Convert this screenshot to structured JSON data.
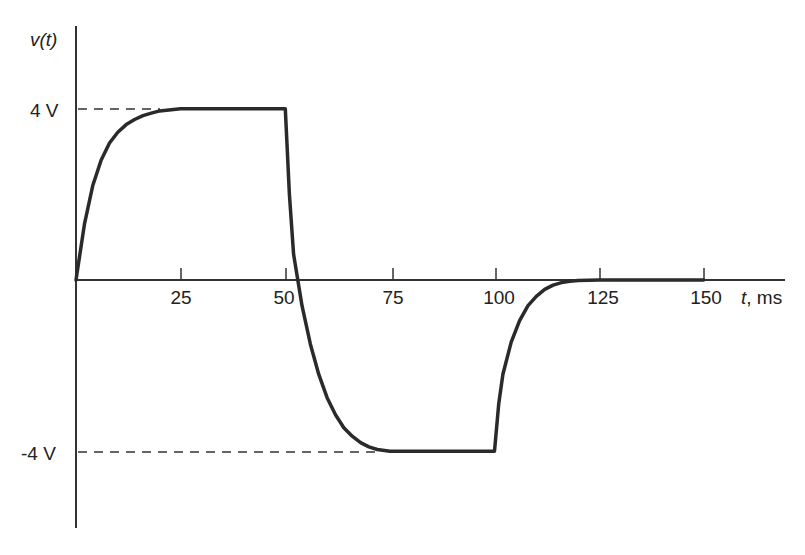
{
  "chart_data": {
    "type": "line",
    "title": "",
    "ylabel": "v(t)",
    "xlabel": "t, ms",
    "x_ticks": [
      25,
      50,
      75,
      100,
      125,
      150
    ],
    "x_tick_labels": [
      "25",
      "50",
      "75",
      "100",
      "125",
      "150"
    ],
    "y_ticks": [
      4,
      -4
    ],
    "y_tick_labels": [
      "4 V",
      "-4 V"
    ],
    "xlim": [
      0,
      160
    ],
    "ylim": [
      -6,
      6
    ],
    "grid": false,
    "reference_lines": [
      {
        "y": 4,
        "style": "dashed",
        "from_x": 0,
        "to_x": 20
      },
      {
        "y": -4,
        "style": "dashed",
        "from_x": 0,
        "to_x": 72
      }
    ],
    "series": [
      {
        "name": "v(t)",
        "x": [
          0,
          2,
          4,
          6,
          8,
          10,
          12,
          14,
          16,
          18,
          20,
          25,
          50,
          51,
          52,
          53,
          54,
          56,
          58,
          60,
          62,
          64,
          66,
          68,
          70,
          72,
          75,
          100,
          101,
          102,
          104,
          106,
          108,
          110,
          112,
          114,
          116,
          118,
          120,
          125,
          150
        ],
        "values": [
          0,
          1.3,
          2.2,
          2.8,
          3.2,
          3.45,
          3.63,
          3.75,
          3.84,
          3.9,
          3.95,
          4.0,
          4.0,
          2.0,
          0.6,
          0.0,
          -0.6,
          -1.5,
          -2.2,
          -2.75,
          -3.15,
          -3.45,
          -3.65,
          -3.8,
          -3.9,
          -3.96,
          -4.0,
          -4.0,
          -2.9,
          -2.2,
          -1.45,
          -0.95,
          -0.6,
          -0.38,
          -0.22,
          -0.12,
          -0.06,
          -0.03,
          -0.01,
          0.0,
          0.0
        ]
      }
    ]
  },
  "labels": {
    "y_axis": "v(t)",
    "x_axis": "t, ms",
    "y_pos": "4 V",
    "y_neg": "-4 V",
    "x25": "25",
    "x50": "50",
    "x75": "75",
    "x100": "100",
    "x125": "125",
    "x150": "150"
  },
  "colors": {
    "line": "#2a2a2a",
    "axis": "#333333",
    "text": "#222222"
  }
}
